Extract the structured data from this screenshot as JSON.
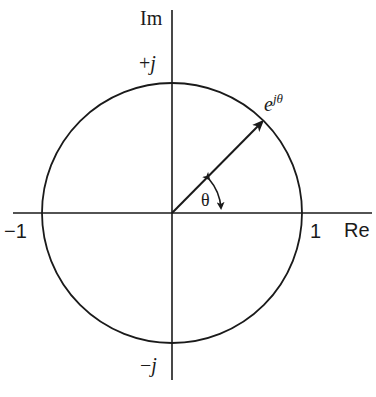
{
  "diagram": {
    "type": "unit-circle-complex-plane",
    "colors": {
      "stroke": "#1a1a1a",
      "background": "#ffffff"
    },
    "axes": {
      "real_label": "Re",
      "imag_label": "Im"
    },
    "tick_labels": {
      "plus_one": "1",
      "minus_one": "−1",
      "plus_j_sign": "+",
      "plus_j_var": "j",
      "minus_j_sign": "−",
      "minus_j_var": "j"
    },
    "vector": {
      "label_base": "e",
      "label_exponent": "jθ"
    },
    "angle": {
      "label": "θ"
    }
  }
}
